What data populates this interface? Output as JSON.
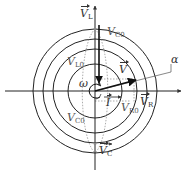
{
  "diagram": {
    "type": "phasor-diagram",
    "center": [
      95,
      91
    ],
    "circle_radii": [
      27,
      42,
      52,
      62
    ],
    "colors": {
      "axes": "#222222",
      "circles": "#222222",
      "phasor": "#111111",
      "dotted": "#888888"
    }
  },
  "labels": {
    "v_l": "V",
    "v_l_sub": "L",
    "v_c0_top": "V",
    "v_c0_top_sub": "C0",
    "v_l0": "V",
    "v_l0_sub": "L0",
    "v": "V",
    "alpha": "α",
    "omega": "ω",
    "i": "I",
    "v_r0": "V",
    "v_r0_sub": "R0",
    "v_r": "V",
    "v_r_sub": "R",
    "v_c0_bottom": "V",
    "v_c0_bottom_sub": "C0",
    "v_c": "V",
    "v_c_sub": "C"
  }
}
